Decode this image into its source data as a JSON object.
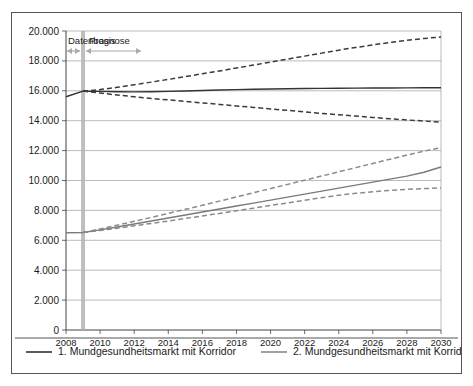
{
  "chart_data": {
    "type": "line",
    "title": "",
    "xlabel": "",
    "ylabel": "",
    "xlim": [
      2008,
      2030
    ],
    "ylim": [
      0,
      20000
    ],
    "grid": true,
    "y_tick_step": 2000,
    "x_tick_step": 2,
    "number_format": "de-DE (thousands separated by period)",
    "legend_position": "bottom",
    "xticks": [
      "2008",
      "2010",
      "2012",
      "2014",
      "2016",
      "2018",
      "2020",
      "2022",
      "2024",
      "2026",
      "2028",
      "2030"
    ],
    "yticks": [
      "0",
      "2.000",
      "4.000",
      "6.000",
      "8.000",
      "10.000",
      "12.000",
      "14.000",
      "16.000",
      "18.000",
      "20.000"
    ],
    "x": [
      2008,
      2009,
      2010,
      2011,
      2012,
      2013,
      2014,
      2015,
      2016,
      2017,
      2018,
      2019,
      2020,
      2021,
      2022,
      2023,
      2024,
      2025,
      2026,
      2027,
      2028,
      2029,
      2030
    ],
    "annotations": [
      {
        "name": "datenbasis",
        "label": "Datenbasis",
        "x_range": [
          2008,
          2009
        ],
        "arrow": "double"
      },
      {
        "name": "prognose",
        "label": "Prognose",
        "x_range": [
          2009,
          2030
        ],
        "arrow": "double"
      },
      {
        "name": "divider-band",
        "label": "",
        "x": 2009,
        "color": "#b3b3b3"
      }
    ],
    "series": [
      {
        "name": "1. Mundgesundheitsmarkt mit Korridor",
        "style": "solid",
        "color": "#333333",
        "values": [
          15600,
          15980,
          15960,
          15940,
          15930,
          15940,
          15960,
          15990,
          16020,
          16050,
          16080,
          16100,
          16120,
          16135,
          16150,
          16160,
          16170,
          16180,
          16185,
          16190,
          16195,
          16200,
          16200
        ]
      },
      {
        "name": "1. Korridor oben",
        "style": "dashed",
        "color": "#3a3a3a",
        "values": [
          null,
          15980,
          16080,
          16230,
          16400,
          16580,
          16760,
          16950,
          17140,
          17330,
          17520,
          17720,
          17920,
          18120,
          18320,
          18520,
          18720,
          18900,
          19070,
          19230,
          19380,
          19500,
          19600
        ]
      },
      {
        "name": "1. Korridor unten",
        "style": "dashed",
        "color": "#3a3a3a",
        "values": [
          null,
          15980,
          15850,
          15720,
          15600,
          15490,
          15390,
          15290,
          15190,
          15090,
          14990,
          14890,
          14790,
          14690,
          14590,
          14490,
          14400,
          14310,
          14220,
          14130,
          14050,
          13980,
          13900
        ]
      },
      {
        "name": "2. Mundgesundheitsmarkt mit Korridor",
        "style": "solid",
        "color": "#7a7a7a",
        "values": [
          6500,
          6520,
          6700,
          6890,
          7090,
          7290,
          7490,
          7690,
          7890,
          8090,
          8290,
          8490,
          8690,
          8890,
          9090,
          9290,
          9490,
          9690,
          9890,
          10090,
          10290,
          10550,
          10900
        ]
      },
      {
        "name": "2. Korridor oben",
        "style": "dashed",
        "color": "#8a8a8a",
        "values": [
          null,
          6520,
          6760,
          7010,
          7270,
          7530,
          7800,
          8070,
          8340,
          8620,
          8900,
          9180,
          9460,
          9740,
          10020,
          10300,
          10580,
          10860,
          11140,
          11420,
          11700,
          11960,
          12200
        ]
      },
      {
        "name": "2. Korridor unten",
        "style": "dashed",
        "color": "#8a8a8a",
        "values": [
          null,
          6520,
          6660,
          6810,
          6970,
          7130,
          7290,
          7460,
          7630,
          7800,
          7970,
          8150,
          8330,
          8500,
          8680,
          8850,
          9020,
          9140,
          9250,
          9340,
          9410,
          9460,
          9500
        ]
      }
    ],
    "legend": [
      {
        "label": "1. Mundgesundheitsmarkt mit Korridor",
        "color": "#333333",
        "style": "solid"
      },
      {
        "label": "2. Mundgesundheitsmarkt mit Korridor",
        "color": "#8a8a8a",
        "style": "solid"
      }
    ]
  }
}
